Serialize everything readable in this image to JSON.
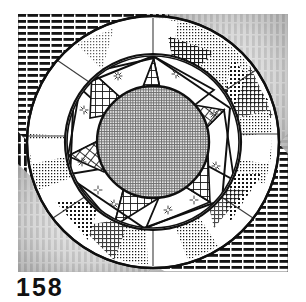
{
  "figure": {
    "caption_number": "158",
    "frame": {
      "x": 18,
      "y": 14,
      "width": 270,
      "height": 258
    },
    "colors": {
      "ink": "#1a1a1a",
      "paper": "#ffffff",
      "center_fill": "#a8a8a8",
      "corner_gray": "#c9c9c9",
      "mid_gray": "#8e8e8e",
      "light_gray": "#d9d9d9"
    },
    "geometry": {
      "center_x": 135,
      "center_y": 128,
      "outer_circle_r": 126,
      "annulus_inner_r": 88,
      "star_circle_r": 86,
      "center_circle_r": 56,
      "star_points": 6,
      "star_rotation_deg": 12
    },
    "corner_wedges": [
      {
        "name": "top-left",
        "hatch": "horizontal-lines"
      },
      {
        "name": "top-right",
        "hatch": "vertical-lines"
      },
      {
        "name": "bottom-left",
        "hatch": "vertical-lines"
      },
      {
        "name": "bottom-right",
        "hatch": "horizontal-lines"
      }
    ],
    "annulus_patches": [
      {
        "index": 0,
        "hatch": "fine-dots",
        "angle_deg": 8
      },
      {
        "index": 1,
        "hatch": "coarse-dots",
        "angle_deg": 48
      },
      {
        "index": 2,
        "hatch": "cross-hatch",
        "angle_deg": 96
      },
      {
        "index": 3,
        "hatch": "fine-dots",
        "angle_deg": 140
      },
      {
        "index": 4,
        "hatch": "coarse-dots",
        "angle_deg": 186
      },
      {
        "index": 5,
        "hatch": "cross-hatch",
        "angle_deg": 232
      },
      {
        "index": 6,
        "hatch": "fine-dots",
        "angle_deg": 278
      },
      {
        "index": 7,
        "hatch": "coarse-dots",
        "angle_deg": 318
      }
    ],
    "star_sectors": [
      {
        "index": 0,
        "hatch": "grid",
        "angle_deg": 12
      },
      {
        "index": 1,
        "hatch": "grid",
        "angle_deg": 72
      },
      {
        "index": 2,
        "hatch": "grid",
        "angle_deg": 132
      },
      {
        "index": 3,
        "hatch": "grid",
        "angle_deg": 192
      },
      {
        "index": 4,
        "hatch": "grid",
        "angle_deg": 252
      },
      {
        "index": 5,
        "hatch": "grid",
        "angle_deg": 312
      }
    ],
    "sparkles": [
      {
        "x": 100,
        "y": 62
      },
      {
        "x": 158,
        "y": 60
      },
      {
        "x": 196,
        "y": 100
      },
      {
        "x": 198,
        "y": 152
      },
      {
        "x": 150,
        "y": 196
      },
      {
        "x": 96,
        "y": 190
      },
      {
        "x": 64,
        "y": 148
      },
      {
        "x": 66,
        "y": 96
      },
      {
        "x": 176,
        "y": 186
      },
      {
        "x": 80,
        "y": 176
      }
    ]
  }
}
